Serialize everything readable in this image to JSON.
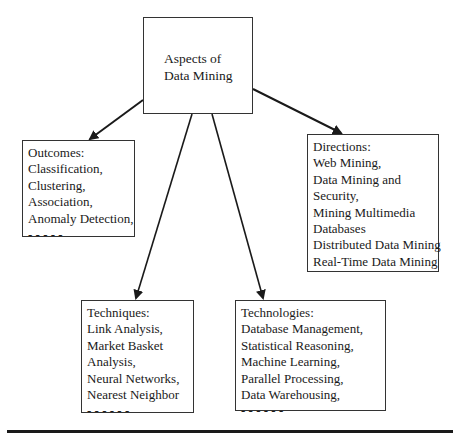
{
  "diagram": {
    "root": {
      "lines": [
        "Aspects of",
        "Data Mining"
      ]
    },
    "outcomes": {
      "lines": [
        "Outcomes:",
        "Classification,",
        "Clustering,",
        "Association,",
        "Anomaly Detection,",
        "- - - - -"
      ]
    },
    "directions": {
      "lines": [
        "Directions:",
        "Web Mining,",
        "Data Mining and",
        "Security,",
        "Mining Multimedia",
        "Databases",
        "Distributed Data Mining",
        "Real-Time Data Mining"
      ]
    },
    "techniques": {
      "lines": [
        "Techniques:",
        "Link Analysis,",
        "Market Basket",
        "Analysis,",
        "Neural Networks,",
        "Nearest Neighbor",
        "- - - - - -"
      ]
    },
    "technologies": {
      "lines": [
        "Technologies:",
        "Database Management,",
        "Statistical Reasoning,",
        "Machine Learning,",
        "Parallel Processing,",
        "Data Warehousing,",
        "- - - - - -"
      ]
    },
    "edges": [
      {
        "from": "root",
        "to": "outcomes"
      },
      {
        "from": "root",
        "to": "techniques"
      },
      {
        "from": "root",
        "to": "technologies"
      },
      {
        "from": "root",
        "to": "directions"
      }
    ],
    "colors": {
      "line": "#1a1a1a",
      "border": "#333333",
      "background": "#ffffff"
    }
  }
}
